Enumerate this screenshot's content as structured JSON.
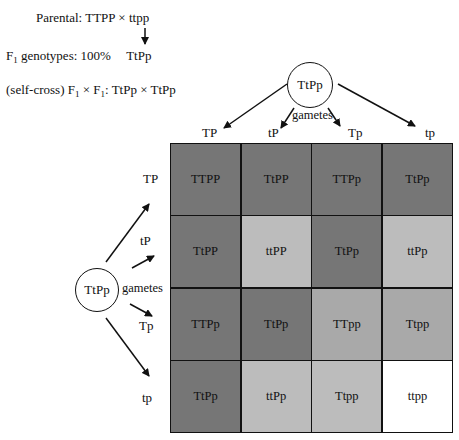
{
  "header": {
    "parental_label": "Parental:",
    "parental_cross": "TTPP × ttpp",
    "f1_label": "F",
    "f1_sub": "1",
    "f1_text": " genotypes: 100%",
    "f1_genotype": "TtPp",
    "selfcross_prefix": "(self-cross) F",
    "selfcross_sub1": "1",
    "selfcross_times": " × F",
    "selfcross_sub2": "1",
    "selfcross_cross": ": TtPp × TtPp"
  },
  "top_parent": {
    "genotype": "TtPp",
    "gametes_label": "gametes",
    "gametes": [
      "TP",
      "tP",
      "Tp",
      "tp"
    ]
  },
  "left_parent": {
    "genotype": "TtPp",
    "gametes_label": "gametes",
    "gametes": [
      "TP",
      "tP",
      "Tp",
      "tp"
    ]
  },
  "colors": {
    "dark": "#767676",
    "medium": "#a9a9a9",
    "light": "#bcbcbc",
    "white": "#ffffff"
  },
  "punnett": {
    "rows": [
      [
        {
          "g": "TTPP",
          "shade": "dark"
        },
        {
          "g": "TtPP",
          "shade": "dark"
        },
        {
          "g": "TTPp",
          "shade": "dark"
        },
        {
          "g": "TtPp",
          "shade": "dark"
        }
      ],
      [
        {
          "g": "TtPP",
          "shade": "dark"
        },
        {
          "g": "ttPP",
          "shade": "light"
        },
        {
          "g": "TtPp",
          "shade": "dark"
        },
        {
          "g": "ttPp",
          "shade": "light"
        }
      ],
      [
        {
          "g": "TTPp",
          "shade": "dark"
        },
        {
          "g": "TtPp",
          "shade": "dark"
        },
        {
          "g": "TTpp",
          "shade": "medium"
        },
        {
          "g": "Ttpp",
          "shade": "medium"
        }
      ],
      [
        {
          "g": "TtPp",
          "shade": "dark"
        },
        {
          "g": "ttPp",
          "shade": "light"
        },
        {
          "g": "Ttpp",
          "shade": "light"
        },
        {
          "g": "ttpp",
          "shade": "white"
        }
      ]
    ]
  }
}
